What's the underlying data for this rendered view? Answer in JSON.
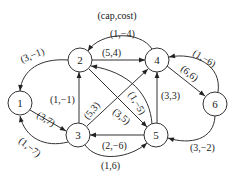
{
  "legend": "(cap,cost)",
  "colors": {
    "stroke": "#333333",
    "text": "#222222",
    "background": "#ffffff"
  },
  "nodes": [
    {
      "id": "1",
      "label": "1"
    },
    {
      "id": "2",
      "label": "2"
    },
    {
      "id": "3",
      "label": "3"
    },
    {
      "id": "4",
      "label": "4"
    },
    {
      "id": "5",
      "label": "5"
    },
    {
      "id": "6",
      "label": "6"
    }
  ],
  "edges": [
    {
      "from": "2",
      "to": "1",
      "label": "(3,−1)"
    },
    {
      "from": "1",
      "to": "3",
      "label": "(3,7)"
    },
    {
      "from": "3",
      "to": "1",
      "label": "(1,−7)"
    },
    {
      "from": "3",
      "to": "2",
      "label": "(1,−1)"
    },
    {
      "from": "2",
      "to": "4",
      "label": "(5,4)"
    },
    {
      "from": "4",
      "to": "2",
      "label": "(1,−4)"
    },
    {
      "from": "3",
      "to": "4",
      "label": "(5,3)"
    },
    {
      "from": "2",
      "to": "5",
      "label": "(3,5)"
    },
    {
      "from": "5",
      "to": "2",
      "label": "(1,−5)"
    },
    {
      "from": "5",
      "to": "4",
      "label": "(3,3)"
    },
    {
      "from": "4",
      "to": "6",
      "label": "(6,6)"
    },
    {
      "from": "6",
      "to": "4",
      "label": "(1,−6)"
    },
    {
      "from": "5",
      "to": "3",
      "label": "(2,−6)"
    },
    {
      "from": "3",
      "to": "5",
      "label": "(1,6)"
    },
    {
      "from": "6",
      "to": "5",
      "label": "(3,−2)"
    }
  ]
}
